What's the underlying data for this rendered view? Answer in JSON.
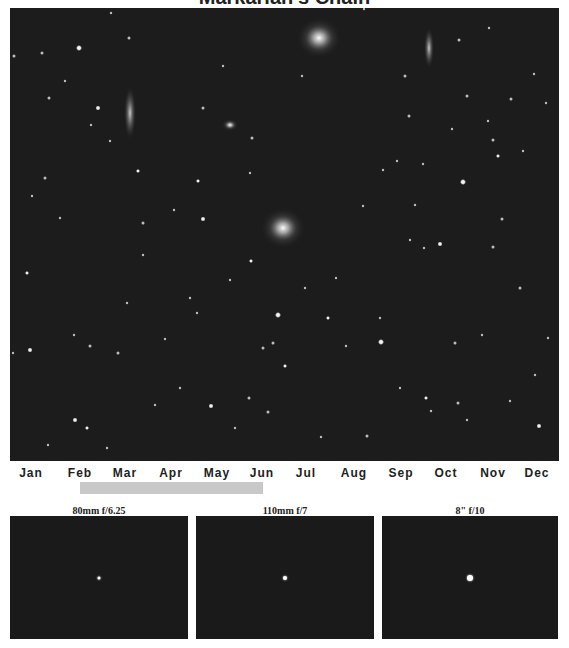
{
  "title": "Markarian's Chain",
  "sky_image": {
    "description": "Deep-sky star field with galaxies",
    "background_color": "#1c1c1c",
    "galaxies": [
      {
        "name": "elliptical-galaxy-top",
        "x": 309,
        "y": 30,
        "rx": 14,
        "ry": 14
      },
      {
        "name": "elliptical-galaxy-center",
        "x": 273,
        "y": 220,
        "rx": 14,
        "ry": 14
      },
      {
        "name": "edge-on-galaxy-left",
        "x": 120,
        "y": 105,
        "rx": 4,
        "ry": 20
      },
      {
        "name": "edge-on-galaxy-right",
        "x": 419,
        "y": 40,
        "rx": 3,
        "ry": 15
      },
      {
        "name": "small-galaxy",
        "x": 220,
        "y": 117,
        "rx": 5,
        "ry": 4
      }
    ]
  },
  "months": [
    {
      "label": "Jan",
      "x": 31
    },
    {
      "label": "Feb",
      "x": 80
    },
    {
      "label": "Mar",
      "x": 125
    },
    {
      "label": "Apr",
      "x": 171
    },
    {
      "label": "May",
      "x": 217
    },
    {
      "label": "Jun",
      "x": 262
    },
    {
      "label": "Jul",
      "x": 306
    },
    {
      "label": "Aug",
      "x": 354
    },
    {
      "label": "Sep",
      "x": 401
    },
    {
      "label": "Oct",
      "x": 446
    },
    {
      "label": "Nov",
      "x": 493
    },
    {
      "label": "Dec",
      "x": 537
    }
  ],
  "visibility_range": {
    "start": "Feb",
    "end": "Jun",
    "color": "#c8c8c8"
  },
  "telescopes": [
    {
      "label": "80mm f/6.25",
      "star_size": 3
    },
    {
      "label": "110mm f/7",
      "star_size": 4
    },
    {
      "label": "8\" f/10",
      "star_size": 6
    }
  ]
}
